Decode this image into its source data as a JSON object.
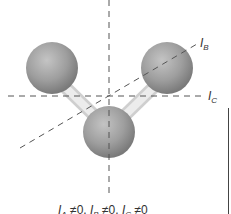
{
  "diagram": {
    "type": "molecule-principal-axes",
    "atoms": [
      {
        "id": "left",
        "cx": 52,
        "cy": 68,
        "r": 26
      },
      {
        "id": "right",
        "cx": 167,
        "cy": 68,
        "r": 26
      },
      {
        "id": "bottom",
        "cx": 109,
        "cy": 132,
        "r": 26
      }
    ],
    "bonds": [
      {
        "from": "left",
        "to": "bottom"
      },
      {
        "from": "right",
        "to": "bottom"
      }
    ],
    "axes": {
      "A": {
        "label": "I",
        "sub": "A"
      },
      "B": {
        "label": "I",
        "sub": "B"
      },
      "C": {
        "label": "I",
        "sub": "C"
      }
    },
    "colors": {
      "atom": "#9a9a9a",
      "bond": "#e6e6e6",
      "axis": "#555555"
    }
  },
  "caption": {
    "parts": [
      {
        "sym": "I",
        "sub": "A",
        "rel": "≠",
        "val": "0,"
      },
      {
        "sym": "I",
        "sub": "B",
        "rel": "≠",
        "val": "0,"
      },
      {
        "sym": "I",
        "sub": "C",
        "rel": "≠",
        "val": "0"
      }
    ]
  }
}
